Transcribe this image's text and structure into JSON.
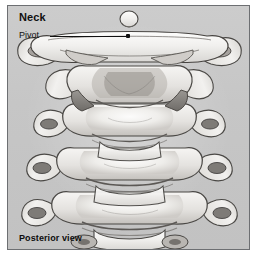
{
  "figure": {
    "heading": "Neck",
    "caption": "Posterior view",
    "style": "grayscale pencil medical illustration",
    "background_color": "#c9c9c9",
    "border_color": "#6d6f72",
    "page_color": "#ffffff",
    "ink_color": "#111111"
  },
  "annotations": [
    {
      "label": "Pivot",
      "leader": "horizontal-line-with-dot",
      "target": "atlas-pivot-joint"
    }
  ],
  "illustration": {
    "view": "posterior",
    "vertebrae_count": 5,
    "parts": [
      "dens-tip",
      "atlas",
      "axis",
      "cervical-vertebra-3",
      "cervical-vertebra-4",
      "cervical-vertebra-5",
      "transverse-process-left",
      "transverse-process-right",
      "vertebral-body",
      "spinous-process"
    ]
  }
}
